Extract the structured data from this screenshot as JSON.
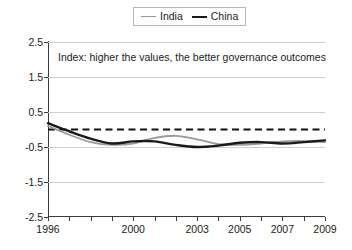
{
  "legend": {
    "position": "top-center",
    "entries": [
      {
        "label": "India",
        "color": "#9a9a9a",
        "icon": "line-swatch-icon"
      },
      {
        "label": "China",
        "color": "#1a1a1a",
        "icon": "line-swatch-icon"
      }
    ]
  },
  "annotation": {
    "text": "Index: higher the values, the better governance outcomes"
  },
  "chart_data": {
    "type": "line",
    "title": "",
    "subtitle": "",
    "xlabel": "",
    "ylabel": "",
    "annotations": [
      "Index: higher the values, the better governance outcomes"
    ],
    "grid": true,
    "legend_position": "top-center",
    "xlim": [
      1996,
      2009
    ],
    "ylim": [
      -2.5,
      2.5
    ],
    "ytick_labels": [
      "2.5",
      "1.5",
      "0.5",
      "-0.5",
      "-1.5",
      "-2.5"
    ],
    "yticks": [
      2.5,
      1.5,
      0.5,
      -0.5,
      -1.5,
      -2.5
    ],
    "xtick_labels": [
      "1996",
      "2000",
      "2003",
      "2005",
      "2007",
      "2009"
    ],
    "xticks": [
      1996,
      2000,
      2003,
      2005,
      2007,
      2009
    ],
    "x": [
      1996,
      1997,
      1998,
      1999,
      2000,
      2001,
      2002,
      2003,
      2004,
      2005,
      2006,
      2007,
      2008,
      2009
    ],
    "reference_line": {
      "value": 0.0,
      "style": "dashed",
      "color": "#111111"
    },
    "series": [
      {
        "name": "India",
        "color": "#9a9a9a",
        "width": 1.8,
        "values": [
          0.1,
          -0.15,
          -0.36,
          -0.44,
          -0.4,
          -0.24,
          -0.18,
          -0.28,
          -0.42,
          -0.44,
          -0.4,
          -0.34,
          -0.33,
          -0.36
        ]
      },
      {
        "name": "China",
        "color": "#1a1a1a",
        "width": 2.4,
        "values": [
          0.18,
          -0.05,
          -0.26,
          -0.4,
          -0.34,
          -0.34,
          -0.44,
          -0.5,
          -0.46,
          -0.38,
          -0.36,
          -0.4,
          -0.36,
          -0.31
        ]
      }
    ]
  }
}
